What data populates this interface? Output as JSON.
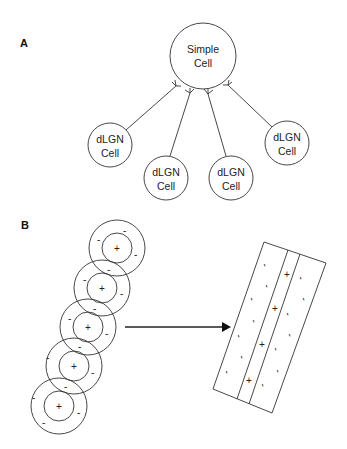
{
  "panel_a": {
    "label": "A",
    "simple_cell": {
      "line1": "Simple",
      "line2": "Cell",
      "cx": 203,
      "cy": 56,
      "r": 33
    },
    "dlgn_cells": [
      {
        "line1": "dLGN",
        "line2": "Cell",
        "cx": 110,
        "cy": 145,
        "r": 22
      },
      {
        "line1": "dLGN",
        "line2": "Cell",
        "cx": 166,
        "cy": 178,
        "r": 22
      },
      {
        "line1": "dLGN",
        "line2": "Cell",
        "cx": 231,
        "cy": 178,
        "r": 22
      },
      {
        "line1": "dLGN",
        "line2": "Cell",
        "cx": 287,
        "cy": 143,
        "r": 22
      }
    ]
  },
  "panel_b": {
    "label": "B",
    "on_sign": "+",
    "off_sign": "-",
    "receptive_fields": [
      {
        "cx": 117,
        "cy": 248
      },
      {
        "cx": 102,
        "cy": 288
      },
      {
        "cx": 88,
        "cy": 327
      },
      {
        "cx": 74,
        "cy": 366
      },
      {
        "cx": 59,
        "cy": 406
      }
    ],
    "arrow": {
      "x1": 125,
      "y1": 327,
      "x2": 230,
      "y2": 327
    }
  }
}
